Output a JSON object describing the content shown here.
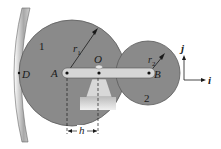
{
  "diagram": {
    "type": "gear-train-mechanism",
    "labels": {
      "gear1_number": "1",
      "gear2_number": "2",
      "radius1": "r",
      "radius1_sub": "1",
      "radius2": "r",
      "radius2_sub": "2",
      "point_A": "A",
      "point_B": "B",
      "point_O": "O",
      "point_D": "D",
      "dimension_h": "h",
      "axis_j": "j",
      "axis_i": "i"
    },
    "colors": {
      "gear_fill": "#8a8a8a",
      "gear_stroke": "#5a5a5a",
      "arm_fill": "#d4d4d4",
      "support_fill": "#c8c8c8",
      "wall_fill": "#b0b0b0",
      "line": "#1a1a1a",
      "background": "#ffffff"
    }
  }
}
